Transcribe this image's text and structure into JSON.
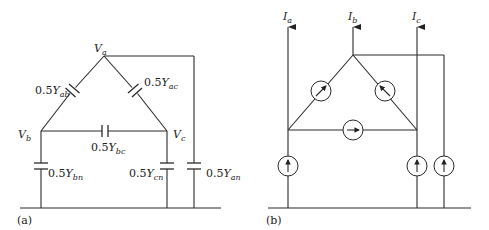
{
  "panel_a": {
    "caption": "(a)",
    "nodes": {
      "va": {
        "main": "V",
        "sub": "a"
      },
      "vb": {
        "main": "V",
        "sub": "b"
      },
      "vc": {
        "main": "V",
        "sub": "c"
      }
    },
    "capacitors": {
      "ab": {
        "coef": "0.5",
        "main": "Y",
        "sub": "ab"
      },
      "ac": {
        "coef": "0.5",
        "main": "Y",
        "sub": "ac"
      },
      "bc": {
        "coef": "0.5",
        "main": "Y",
        "sub": "bc"
      },
      "bn": {
        "coef": "0.5",
        "main": "Y",
        "sub": "bn"
      },
      "cn": {
        "coef": "0.5",
        "main": "Y",
        "sub": "cn"
      },
      "an": {
        "coef": "0.5",
        "main": "Y",
        "sub": "an"
      }
    }
  },
  "panel_b": {
    "caption": "(b)",
    "currents": {
      "ia": {
        "main": "I",
        "sub": "a"
      },
      "ib": {
        "main": "I",
        "sub": "b"
      },
      "ic": {
        "main": "I",
        "sub": "c"
      }
    },
    "sources": {
      "ab": "current-source-diagonal-up-right",
      "ac": "current-source-diagonal-up-left",
      "bc": "current-source-right",
      "a_ground": "current-source-up",
      "c_ground": "current-source-up",
      "b_ground": "current-source-up"
    }
  }
}
